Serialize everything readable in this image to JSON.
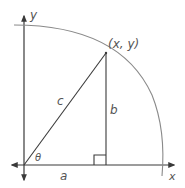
{
  "diagram": {
    "type": "unit-circle-right-triangle",
    "labels": {
      "y_axis": "y",
      "x_axis": "x",
      "point": "(x, y)",
      "hypotenuse": "c",
      "vertical_leg": "b",
      "horizontal_leg": "a",
      "angle": "θ"
    },
    "colors": {
      "axis": "#3a3a3a",
      "arc": "#8a8a8a",
      "text": "#555555"
    }
  }
}
